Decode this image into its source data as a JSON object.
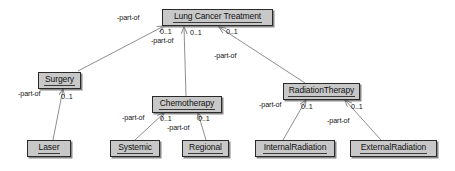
{
  "diagram": {
    "type": "uml-class-diagram",
    "style": {
      "node_fill": "#c8c8c8",
      "node_border": "#2a2a2a",
      "edge_color": "#8f8f8f",
      "text_color": "#111111",
      "background": "#ffffff"
    },
    "nodes": [
      {
        "id": "lung-cancer-treatment",
        "label": "Lung Cancer Treatment",
        "x": 162,
        "y": 9,
        "w": 111,
        "h": 17
      },
      {
        "id": "surgery",
        "label": "Surgery",
        "x": 38,
        "y": 72,
        "w": 43,
        "h": 17
      },
      {
        "id": "chemotherapy",
        "label": "Chemotherapy",
        "x": 152,
        "y": 96,
        "w": 70,
        "h": 17
      },
      {
        "id": "radiation-therapy",
        "label": "RadiationTherapy",
        "x": 283,
        "y": 83,
        "w": 77,
        "h": 17
      },
      {
        "id": "laser",
        "label": "Laser",
        "x": 27,
        "y": 140,
        "w": 44,
        "h": 17
      },
      {
        "id": "systemic",
        "label": "Systemic",
        "x": 110,
        "y": 140,
        "w": 50,
        "h": 17
      },
      {
        "id": "regional",
        "label": "Regional",
        "x": 182,
        "y": 140,
        "w": 47,
        "h": 17
      },
      {
        "id": "internal-radiation",
        "label": "InternalRadiation",
        "x": 255,
        "y": 140,
        "w": 80,
        "h": 17
      },
      {
        "id": "external-radiation",
        "label": "ExternalRadiation",
        "x": 350,
        "y": 140,
        "w": 87,
        "h": 17
      }
    ],
    "edges": [
      {
        "id": "surgery-to-treatment",
        "from": "surgery",
        "to": "lung-cancer-treatment",
        "role": "-part-of",
        "multiplicity": "0..1",
        "x1": 78,
        "y1": 71,
        "x2": 164,
        "y2": 26
      },
      {
        "id": "chemotherapy-to-treatment",
        "from": "chemotherapy",
        "to": "lung-cancer-treatment",
        "role": "-part-of",
        "multiplicity": "0..1",
        "x1": 186,
        "y1": 96,
        "x2": 184,
        "y2": 27
      },
      {
        "id": "radiationtherapy-to-treatment",
        "from": "radiation-therapy",
        "to": "lung-cancer-treatment",
        "role": "-part-of",
        "multiplicity": "0..1",
        "x1": 305,
        "y1": 83,
        "x2": 219,
        "y2": 27
      },
      {
        "id": "laser-to-surgery",
        "from": "laser",
        "to": "surgery",
        "role": "-part-of",
        "multiplicity": "0..1",
        "x1": 53,
        "y1": 140,
        "x2": 63,
        "y2": 89
      },
      {
        "id": "systemic-to-chemotherapy",
        "from": "systemic",
        "to": "chemotherapy",
        "role": "-part-of",
        "multiplicity": "0..1",
        "x1": 135,
        "y1": 140,
        "x2": 164,
        "y2": 113
      },
      {
        "id": "regional-to-chemotherapy",
        "from": "regional",
        "to": "chemotherapy",
        "role": "-part-of",
        "multiplicity": "0..1",
        "x1": 206,
        "y1": 140,
        "x2": 198,
        "y2": 113
      },
      {
        "id": "internalradiation-to-radiation",
        "from": "internal-radiation",
        "to": "radiation-therapy",
        "role": "-part-of",
        "multiplicity": "0..1",
        "x1": 283,
        "y1": 140,
        "x2": 306,
        "y2": 100
      },
      {
        "id": "externalradiation-to-radiation",
        "from": "external-radiation",
        "to": "radiation-therapy",
        "role": "-part-of",
        "multiplicity": "0..1",
        "x1": 381,
        "y1": 140,
        "x2": 345,
        "y2": 100
      }
    ],
    "labels": [
      {
        "id": "label-part-of-surgery-top",
        "text": "-part-of",
        "x": 117,
        "y": 14
      },
      {
        "id": "label-mult-surgery-top",
        "text": "0..1",
        "x": 160,
        "y": 28
      },
      {
        "id": "label-part-of-surgery-top2",
        "text": "-part-of",
        "x": 151,
        "y": 37
      },
      {
        "id": "label-mult-chemo-top",
        "text": "0..1",
        "x": 190,
        "y": 29
      },
      {
        "id": "label-mult-radiation-top",
        "text": "0..1",
        "x": 226,
        "y": 28
      },
      {
        "id": "label-part-of-radiation-top",
        "text": "-part-of",
        "x": 214,
        "y": 52
      },
      {
        "id": "label-part-of-laser",
        "text": "-part-of",
        "x": 18,
        "y": 90
      },
      {
        "id": "label-mult-laser",
        "text": "0..1",
        "x": 61,
        "y": 93
      },
      {
        "id": "label-part-of-systemic",
        "text": "-part-of",
        "x": 122,
        "y": 114
      },
      {
        "id": "label-mult-systemic",
        "text": "0..1",
        "x": 160,
        "y": 115
      },
      {
        "id": "label-part-of-regional",
        "text": "-part-of",
        "x": 167,
        "y": 124
      },
      {
        "id": "label-mult-regional",
        "text": "0..1",
        "x": 198,
        "y": 115
      },
      {
        "id": "label-part-of-internal",
        "text": "-part-of",
        "x": 259,
        "y": 101
      },
      {
        "id": "label-mult-internal",
        "text": "0..1",
        "x": 301,
        "y": 103
      },
      {
        "id": "label-part-of-external",
        "text": "-part-of",
        "x": 327,
        "y": 117
      },
      {
        "id": "label-mult-external",
        "text": "0..1",
        "x": 351,
        "y": 103
      }
    ]
  }
}
